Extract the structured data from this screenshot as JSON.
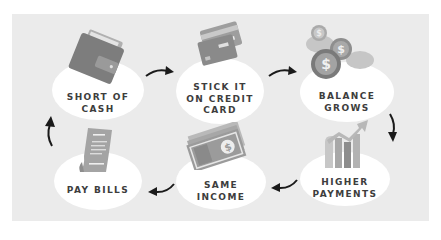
{
  "diagram": {
    "type": "cycle",
    "steps": [
      {
        "id": "short-of-cash",
        "label": "SHORT OF\nCASH",
        "icon": "wallet-icon"
      },
      {
        "id": "stick-it-on-credit-card",
        "label": "STICK IT\nON CREDIT\nCARD",
        "icon": "credit-cards-icon"
      },
      {
        "id": "balance-grows",
        "label": "BALANCE\nGROWS",
        "icon": "coins-icon"
      },
      {
        "id": "higher-payments",
        "label": "HIGHER\nPAYMENTS",
        "icon": "rising-bar-chart-icon"
      },
      {
        "id": "same-income",
        "label": "SAME\nINCOME",
        "icon": "cash-bills-icon"
      },
      {
        "id": "pay-bills",
        "label": "PAY BILLS",
        "icon": "receipt-icon"
      }
    ],
    "flow": [
      "short-of-cash",
      "stick-it-on-credit-card",
      "balance-grows",
      "higher-payments",
      "same-income",
      "pay-bills",
      "short-of-cash"
    ]
  },
  "colors": {
    "panel": "#ebebeb",
    "blob": "#ffffff",
    "text": "#3d3d3d",
    "icon_dark": "#7d7d7d",
    "icon_mid": "#9c9c9c",
    "icon_light": "#b5b5b5",
    "arrow": "#1a1a1a"
  }
}
